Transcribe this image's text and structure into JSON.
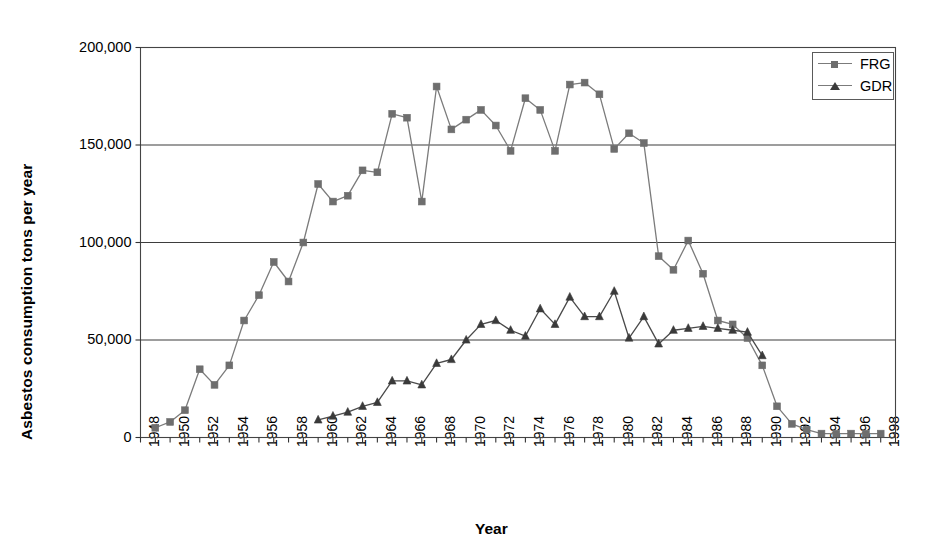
{
  "chart_data": {
    "type": "line",
    "title": "",
    "xlabel": "Year",
    "ylabel": "Asbestos consumption tons per year",
    "ylim": [
      0,
      200000
    ],
    "xlim": [
      1948,
      1999
    ],
    "grid": "horizontal",
    "legend_position": "top-right",
    "ytick_labels": [
      "200,000",
      "150,000",
      "100,000",
      "50,000",
      "0"
    ],
    "ytick_values": [
      200000,
      150000,
      100000,
      50000,
      0
    ],
    "xtick_labels": [
      "1948",
      "1950",
      "1952",
      "1954",
      "1956",
      "1958",
      "1960",
      "1962",
      "1964",
      "1966",
      "1968",
      "1970",
      "1972",
      "1974",
      "1976",
      "1978",
      "1980",
      "1982",
      "1984",
      "1986",
      "1988",
      "1990",
      "1992",
      "1994",
      "1996",
      "1998"
    ],
    "xtick_values": [
      1948,
      1950,
      1952,
      1954,
      1956,
      1958,
      1960,
      1962,
      1964,
      1966,
      1968,
      1970,
      1972,
      1974,
      1976,
      1978,
      1980,
      1982,
      1984,
      1986,
      1988,
      1990,
      1992,
      1994,
      1996,
      1998
    ],
    "series": [
      {
        "name": "FRG",
        "marker": "square",
        "color": "#6e6e6e",
        "line_color": "#7b7b7b",
        "x": [
          1949,
          1950,
          1951,
          1952,
          1953,
          1954,
          1955,
          1956,
          1957,
          1958,
          1959,
          1960,
          1961,
          1962,
          1963,
          1964,
          1965,
          1966,
          1967,
          1968,
          1969,
          1970,
          1971,
          1972,
          1973,
          1974,
          1975,
          1976,
          1977,
          1978,
          1979,
          1980,
          1981,
          1982,
          1983,
          1984,
          1985,
          1986,
          1987,
          1988,
          1989,
          1990,
          1991,
          1992,
          1993,
          1994,
          1995,
          1996,
          1997,
          1998
        ],
        "y": [
          5000,
          8000,
          14000,
          35000,
          27000,
          37000,
          60000,
          73000,
          90000,
          80000,
          100000,
          130000,
          121000,
          124000,
          137000,
          136000,
          166000,
          164000,
          121000,
          180000,
          158000,
          163000,
          168000,
          160000,
          147000,
          174000,
          168000,
          147000,
          181000,
          182000,
          176000,
          148000,
          156000,
          151000,
          93000,
          86000,
          101000,
          84000,
          60000,
          58000,
          51000,
          37000,
          16000,
          7000,
          4000,
          2000,
          2000,
          2000,
          2000,
          2000
        ]
      },
      {
        "name": "GDR",
        "marker": "triangle",
        "color": "#3a3a3a",
        "line_color": "#4a4a4a",
        "x": [
          1960,
          1961,
          1962,
          1963,
          1964,
          1965,
          1966,
          1967,
          1968,
          1969,
          1970,
          1971,
          1972,
          1973,
          1974,
          1975,
          1976,
          1977,
          1978,
          1979,
          1980,
          1981,
          1982,
          1983,
          1984,
          1985,
          1986,
          1987,
          1988,
          1989,
          1990
        ],
        "y": [
          9000,
          11000,
          13000,
          16000,
          18000,
          29000,
          29000,
          27000,
          38000,
          40000,
          50000,
          58000,
          60000,
          55000,
          52000,
          66000,
          58000,
          72000,
          62000,
          62000,
          75000,
          51000,
          62000,
          48000,
          55000,
          56000,
          57000,
          56000,
          55000,
          54000,
          42000
        ]
      }
    ]
  },
  "legend": {
    "items": [
      {
        "label": "FRG",
        "marker": "square"
      },
      {
        "label": "GDR",
        "marker": "triangle"
      }
    ]
  },
  "axis_titles": {
    "y": "Asbestos consumption tons per year",
    "x": "Year"
  }
}
